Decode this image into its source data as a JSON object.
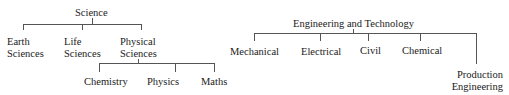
{
  "diagram": {
    "type": "hierarchy",
    "trees": [
      {
        "root": "Science",
        "children": [
          {
            "label": "Earth Sciences",
            "lines": [
              "Earth",
              "Sciences"
            ]
          },
          {
            "label": "Life Sciences",
            "lines": [
              "Life",
              "Sciences"
            ]
          },
          {
            "label": "Physical Sciences",
            "lines": [
              "Physical",
              "Sciences"
            ],
            "children": [
              {
                "label": "Chemistry"
              },
              {
                "label": "Physics"
              },
              {
                "label": "Maths"
              }
            ]
          }
        ]
      },
      {
        "root": "Engineering and Technology",
        "children": [
          {
            "label": "Mechanical"
          },
          {
            "label": "Electrical"
          },
          {
            "label": "Civil"
          },
          {
            "label": "Chemical"
          },
          {
            "label": "Production Engineering",
            "lines": [
              "Production",
              "Engineering"
            ]
          }
        ]
      }
    ],
    "line_color": "#555555",
    "text_color": "#1a1a1a"
  }
}
